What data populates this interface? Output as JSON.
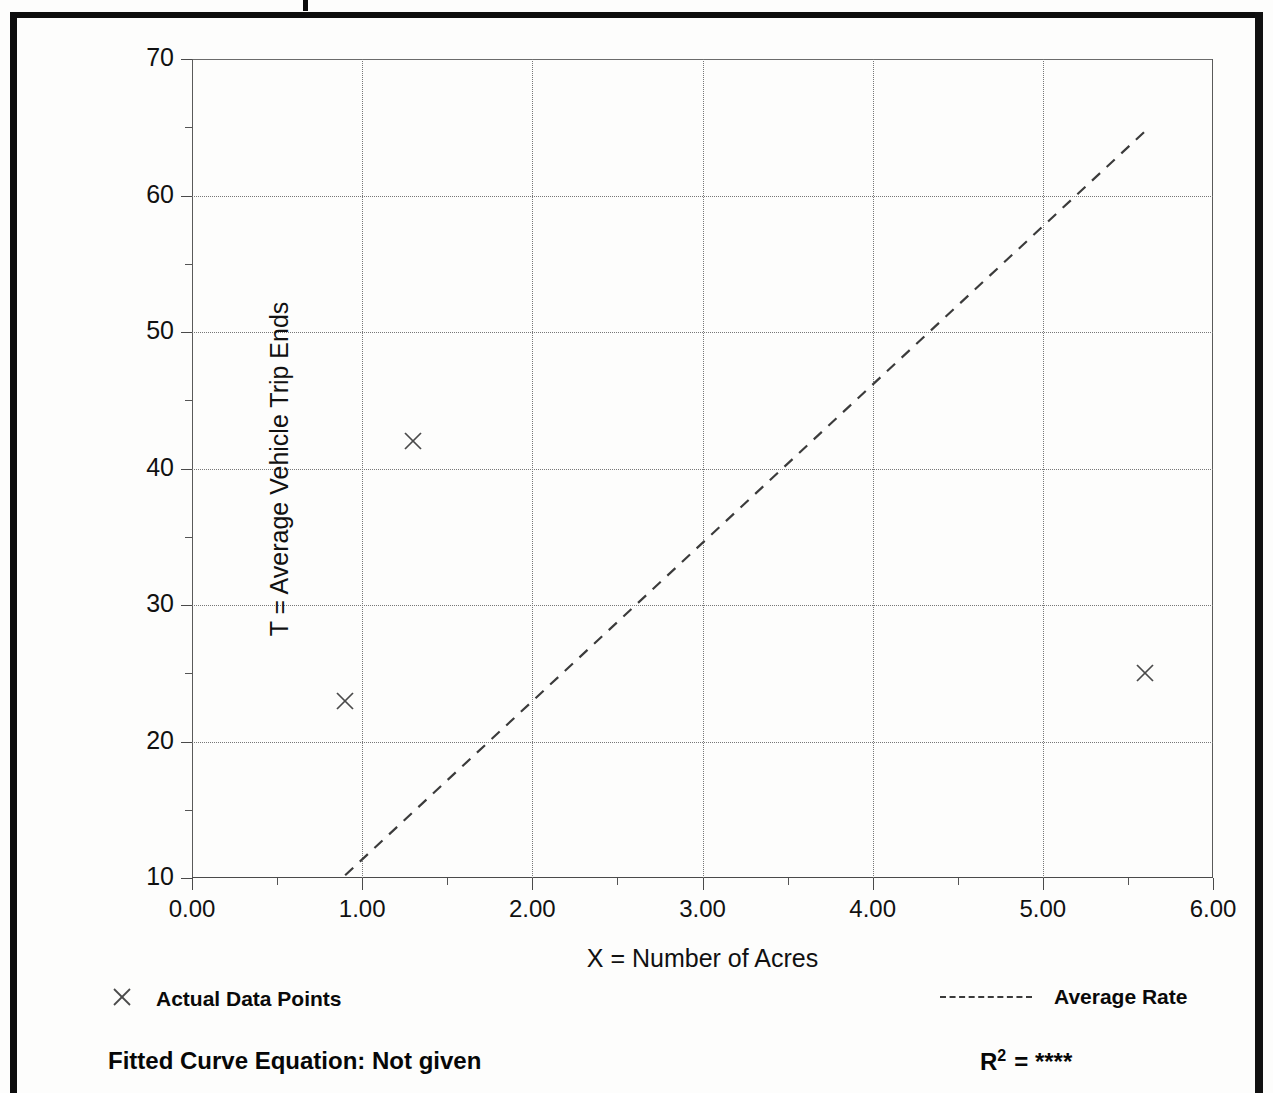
{
  "chart_data": {
    "type": "scatter",
    "title": "",
    "xlabel": "X = Number of Acres",
    "ylabel": "T = Average Vehicle Trip Ends",
    "xlim": [
      0.0,
      6.0
    ],
    "ylim": [
      10,
      70
    ],
    "x_ticks": [
      "0.00",
      "1.00",
      "2.00",
      "3.00",
      "4.00",
      "5.00",
      "6.00"
    ],
    "x_tick_values": [
      0,
      1,
      2,
      3,
      4,
      5,
      6
    ],
    "x_minor_tick_values": [
      0.5,
      1.5,
      2.5,
      3.5,
      4.5,
      5.5
    ],
    "y_ticks": [
      "10",
      "20",
      "30",
      "40",
      "50",
      "60",
      "70"
    ],
    "y_tick_values": [
      10,
      20,
      30,
      40,
      50,
      60,
      70
    ],
    "y_minor_tick_values": [
      15,
      25,
      35,
      45,
      55,
      65
    ],
    "grid": true,
    "grid_style": "dotted",
    "legend_position": "below-plot",
    "series": [
      {
        "name": "Actual Data Points",
        "type": "scatter",
        "marker": "x",
        "points": [
          {
            "x": 0.9,
            "y": 23
          },
          {
            "x": 1.3,
            "y": 42
          },
          {
            "x": 5.6,
            "y": 25
          }
        ]
      },
      {
        "name": "Average Rate",
        "type": "line",
        "style": "dashed",
        "points": [
          {
            "x": 0.9,
            "y": 10.2
          },
          {
            "x": 5.6,
            "y": 64.7
          }
        ]
      }
    ],
    "annotations": {
      "fitted_curve_equation": "Fitted Curve Equation:  Not given",
      "r_squared_label": "R",
      "r_squared_exponent": "2",
      "r_squared_value": "= ****"
    }
  },
  "legend": {
    "actual_data_points": "Actual Data Points",
    "average_rate": "Average Rate",
    "marker_icon": "x-marker-icon",
    "line_icon": "dashed-line-icon"
  },
  "footer": {
    "equation": "Fitted Curve Equation:  Not given",
    "r_label": "R",
    "r_sup": "2",
    "r_value": "= ****"
  },
  "colors": {
    "ink": "#0a0a0a",
    "grid": "#777777",
    "axis": "#4a4a4a",
    "frame": "#0d0d0d",
    "background": "#fdfdfc"
  }
}
